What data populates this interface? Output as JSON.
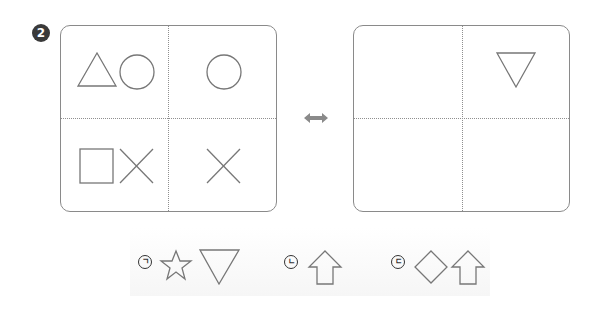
{
  "problem": {
    "number_badge": "2",
    "relation_icon": "bidirectional-arrow-icon"
  },
  "left_panel": {
    "cells": [
      {
        "position": "top-left",
        "shapes": [
          "triangle-up",
          "circle"
        ]
      },
      {
        "position": "top-right",
        "shapes": [
          "circle"
        ]
      },
      {
        "position": "bottom-left",
        "shapes": [
          "square",
          "x-cross"
        ]
      },
      {
        "position": "bottom-right",
        "shapes": [
          "x-cross"
        ]
      }
    ]
  },
  "right_panel": {
    "cells": [
      {
        "position": "top-left",
        "shapes": []
      },
      {
        "position": "top-right",
        "shapes": [
          "triangle-down"
        ]
      },
      {
        "position": "bottom-left",
        "shapes": []
      },
      {
        "position": "bottom-right",
        "shapes": []
      }
    ]
  },
  "options": [
    {
      "label": "ㄱ",
      "shapes": [
        "star",
        "triangle-down"
      ]
    },
    {
      "label": "ㄴ",
      "shapes": [
        "arrow-up"
      ]
    },
    {
      "label": "ㄷ",
      "shapes": [
        "diamond",
        "arrow-up"
      ]
    }
  ],
  "colors": {
    "stroke": "#777777",
    "border": "#8a8a8a",
    "badge": "#3a3a3a",
    "arrow": "#8a8a8a"
  }
}
